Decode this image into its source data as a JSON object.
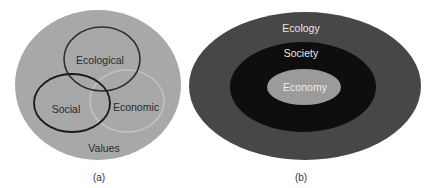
{
  "diagram_a": {
    "caption": "(a)",
    "outer_label": "Values",
    "circles": [
      {
        "label": "Ecological"
      },
      {
        "label": "Social"
      },
      {
        "label": "Economic"
      }
    ],
    "colors": {
      "background": "#a8a8a8",
      "ecological_stroke": "#2e2e2e",
      "social_stroke": "#1a1a1a",
      "economic_stroke": "#c4c4c4",
      "text": "#2a2a2a"
    }
  },
  "diagram_b": {
    "caption": "(b)",
    "layers": [
      {
        "label": "Ecology"
      },
      {
        "label": "Society"
      },
      {
        "label": "Economy"
      }
    ],
    "colors": {
      "ecology_fill": "#474747",
      "society_fill": "#0e0e0e",
      "economy_fill": "#9b9b9b",
      "text": "#e6e6e6"
    }
  }
}
